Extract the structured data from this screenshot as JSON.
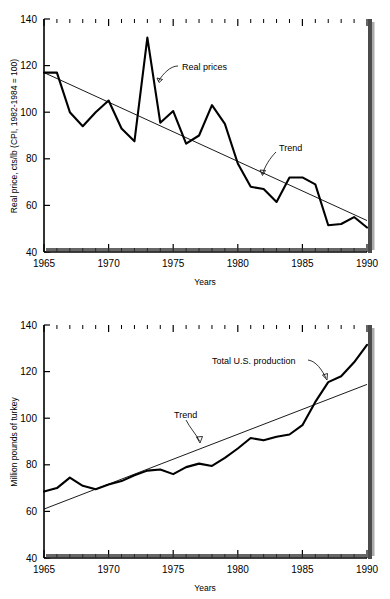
{
  "figure": {
    "background": "#ffffff",
    "ink": "#000000"
  },
  "charts": [
    {
      "id": "real-price-chart",
      "ylabel": "Real price, cts/lb (CPI, 1982-1984 = 100)",
      "xlabel": "Years",
      "ytick_labels": [
        "40",
        "60",
        "80",
        "100",
        "120",
        "140"
      ],
      "xtick_labels": [
        "1965",
        "1970",
        "1975",
        "1980",
        "1985",
        "1990"
      ],
      "annotations": [
        {
          "name": "real-prices-label",
          "text": "Real prices"
        },
        {
          "name": "trend-label",
          "text": "Trend"
        }
      ]
    },
    {
      "id": "production-chart",
      "ylabel": "Million pounds of turkey",
      "xlabel": "Years",
      "ytick_labels": [
        "40",
        "60",
        "80",
        "100",
        "120",
        "140"
      ],
      "xtick_labels": [
        "1965",
        "1970",
        "1975",
        "1980",
        "1985",
        "1990"
      ],
      "annotations": [
        {
          "name": "total-production-label",
          "text": "Total U.S. production"
        },
        {
          "name": "trend-label",
          "text": "Trend"
        }
      ]
    }
  ],
  "chart_data": [
    {
      "type": "line",
      "title": "",
      "xlabel": "Years",
      "ylabel": "Real price, cts/lb (CPI, 1982-1984 = 100)",
      "xlim": [
        1965,
        1990
      ],
      "ylim": [
        40,
        140
      ],
      "xticks": [
        1965,
        1970,
        1975,
        1980,
        1985,
        1990
      ],
      "yticks": [
        40,
        60,
        80,
        100,
        120,
        140
      ],
      "minor_xtick_interval": 1,
      "grid": false,
      "legend": "annotations",
      "x": [
        1965,
        1966,
        1967,
        1968,
        1969,
        1970,
        1971,
        1972,
        1973,
        1974,
        1975,
        1976,
        1977,
        1978,
        1979,
        1980,
        1981,
        1982,
        1983,
        1984,
        1985,
        1986,
        1987,
        1988,
        1989,
        1990
      ],
      "series": [
        {
          "name": "Real prices",
          "values": [
            117,
            117,
            100,
            94,
            100,
            105,
            93,
            87.5,
            132,
            95.5,
            100.5,
            86.5,
            90,
            103,
            95,
            78,
            68,
            67,
            61.5,
            72,
            72,
            69,
            51.5,
            52,
            55,
            50.5
          ]
        },
        {
          "name": "Trend",
          "endpoints": [
            [
              1965,
              117
            ],
            [
              1990,
              53.5
            ]
          ],
          "values": [
            117,
            114.5,
            112,
            109.5,
            107,
            104.5,
            102,
            99.5,
            97,
            94.5,
            92,
            89.5,
            87,
            84.5,
            82,
            79.5,
            76.9,
            74.4,
            71.9,
            69.4,
            66.9,
            64.4,
            61.9,
            59.4,
            56.9,
            53.5
          ]
        }
      ]
    },
    {
      "type": "line",
      "title": "",
      "xlabel": "Years",
      "ylabel": "Million pounds of turkey",
      "xlim": [
        1965,
        1990
      ],
      "ylim": [
        40,
        140
      ],
      "xticks": [
        1965,
        1970,
        1975,
        1980,
        1985,
        1990
      ],
      "yticks": [
        40,
        60,
        80,
        100,
        120,
        140
      ],
      "minor_xtick_interval": 1,
      "grid": false,
      "legend": "annotations",
      "x": [
        1965,
        1966,
        1967,
        1968,
        1969,
        1970,
        1971,
        1972,
        1973,
        1974,
        1975,
        1976,
        1977,
        1978,
        1979,
        1980,
        1981,
        1982,
        1983,
        1984,
        1985,
        1986,
        1987,
        1988,
        1989,
        1990
      ],
      "series": [
        {
          "name": "Total U.S. production",
          "values": [
            68.5,
            70,
            74.5,
            71,
            69.5,
            71.5,
            73,
            75.5,
            77.5,
            78,
            76,
            79,
            80.5,
            79.5,
            83,
            87,
            91.5,
            90.5,
            92,
            93,
            97,
            107,
            115.5,
            118,
            124,
            131.5
          ]
        },
        {
          "name": "Trend",
          "endpoints": [
            [
              1965,
              61
            ],
            [
              1990,
              114.5
            ]
          ],
          "values": [
            61,
            63.1,
            65.3,
            67.4,
            69.5,
            71.7,
            73.8,
            75.9,
            78.1,
            80.2,
            82.3,
            84.5,
            86.6,
            88.7,
            90.9,
            93,
            95.1,
            97.3,
            99.4,
            101.5,
            103.7,
            105.8,
            107.9,
            110.1,
            112.2,
            114.5
          ]
        }
      ]
    }
  ]
}
